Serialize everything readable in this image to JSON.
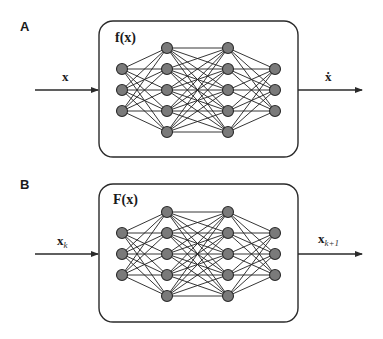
{
  "panels": [
    {
      "id": "A",
      "label": "A",
      "function_label": "f(x)",
      "input_label": "x",
      "input_sub": "",
      "output_label": "ẋ",
      "output_sub": "",
      "offset_y": 0
    },
    {
      "id": "B",
      "label": "B",
      "function_label": "F(x)",
      "input_label": "x",
      "input_sub": "k",
      "output_label": "x",
      "output_sub": "k+1",
      "offset_y": 164
    }
  ],
  "network": {
    "layers": [
      3,
      5,
      5,
      3
    ],
    "layer_x": [
      122,
      167,
      228,
      275
    ],
    "node_spacing": 21,
    "center_y": 90,
    "node_radius": 5.5,
    "node_color": "#7a7a7a"
  }
}
